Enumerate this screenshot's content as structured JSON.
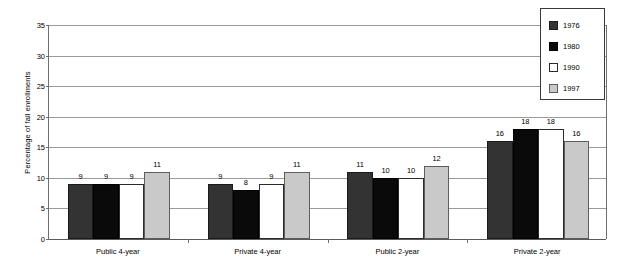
{
  "chart_data": {
    "type": "bar",
    "title": "",
    "xlabel": "",
    "ylabel": "Percentage of fall enrollments",
    "ylim": [
      0,
      35
    ],
    "ytick_step": 5,
    "yticks": [
      "0",
      "5",
      "10",
      "15",
      "20",
      "25",
      "30",
      "35"
    ],
    "grid": true,
    "legend_position": "top-right",
    "categories": [
      "Public 4-year",
      "Private 4-year",
      "Public 2-year",
      "Private 2-year"
    ],
    "series": [
      {
        "name": "1976",
        "color": "#333333",
        "values": [
          9,
          9,
          11,
          16
        ]
      },
      {
        "name": "1980",
        "color": "#0a0a0a",
        "values": [
          9,
          8,
          10,
          18
        ]
      },
      {
        "name": "1990",
        "color": "#ffffff",
        "values": [
          9,
          9,
          10,
          18
        ]
      },
      {
        "name": "1997",
        "color": "#c9c9c9",
        "values": [
          11,
          11,
          12,
          16
        ]
      }
    ],
    "data_labels": [
      [
        "9",
        "9",
        "9",
        "11"
      ],
      [
        "9",
        "8",
        "9",
        "11"
      ],
      [
        "11",
        "10",
        "10",
        "12"
      ],
      [
        "16",
        "18",
        "18",
        "16"
      ]
    ]
  },
  "colors": {
    "axis": "#6e6e6e",
    "gridline": "#9a9a9a",
    "baseline": "#5a5a5a",
    "text": "#000000",
    "background": "#ffffff",
    "legend_border": "#3a3a3a"
  }
}
